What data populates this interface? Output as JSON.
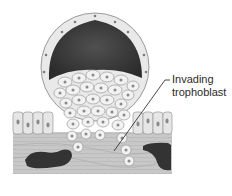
{
  "figure": {
    "labels": [
      {
        "id": "invading-trophoblast",
        "lines": [
          "Invading",
          "trophoblast"
        ]
      }
    ],
    "colors": {
      "cavity": "#3a3a3a",
      "cell_fill": "#efefef",
      "cell_stroke": "#9a9a9a",
      "nucleus": "#8a8a8a",
      "stroma": "#c4c4c4",
      "vessel": "#333333",
      "leader_line": "#333333"
    }
  }
}
